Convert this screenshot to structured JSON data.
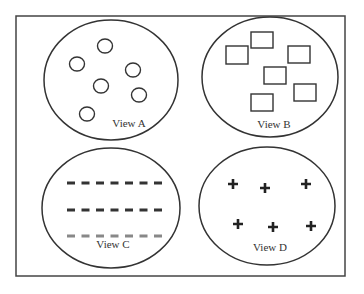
{
  "diagram": {
    "frame": {
      "x": 16,
      "y": 16,
      "width": 329,
      "height": 260,
      "stroke": "#444444"
    },
    "stroke_color": "#333333",
    "views": [
      {
        "id": "a",
        "label": "View A",
        "ellipse": {
          "cx": 111,
          "cy": 80,
          "rx": 67,
          "ry": 60
        },
        "label_pos": {
          "x": 129,
          "y": 127
        },
        "shape": "circle",
        "items": [
          {
            "x": 105,
            "y": 46
          },
          {
            "x": 77,
            "y": 64
          },
          {
            "x": 133,
            "y": 70
          },
          {
            "x": 101,
            "y": 86
          },
          {
            "x": 139,
            "y": 95
          },
          {
            "x": 87,
            "y": 114
          }
        ]
      },
      {
        "id": "b",
        "label": "View B",
        "ellipse": {
          "cx": 270,
          "cy": 77,
          "rx": 68,
          "ry": 60
        },
        "label_pos": {
          "x": 274,
          "y": 128
        },
        "shape": "square",
        "items": [
          {
            "x": 226,
            "y": 46,
            "w": 22,
            "h": 18
          },
          {
            "x": 251,
            "y": 32,
            "w": 22,
            "h": 16
          },
          {
            "x": 288,
            "y": 46,
            "w": 22,
            "h": 17
          },
          {
            "x": 264,
            "y": 67,
            "w": 22,
            "h": 17
          },
          {
            "x": 294,
            "y": 84,
            "w": 22,
            "h": 17
          },
          {
            "x": 251,
            "y": 94,
            "w": 22,
            "h": 17
          }
        ]
      },
      {
        "id": "c",
        "label": "View C",
        "ellipse": {
          "cx": 111,
          "cy": 208,
          "rx": 69,
          "ry": 60
        },
        "label_pos": {
          "x": 113,
          "y": 248
        },
        "shape": "dash",
        "rows": [
          {
            "y": 183,
            "color": "#333333",
            "count": 7,
            "x_start": 67,
            "spacing": 14.5
          },
          {
            "y": 210,
            "color": "#333333",
            "count": 7,
            "x_start": 67,
            "spacing": 14.5
          },
          {
            "y": 236,
            "color": "#888888",
            "count": 7,
            "x_start": 67,
            "spacing": 14.5
          }
        ]
      },
      {
        "id": "d",
        "label": "View D",
        "ellipse": {
          "cx": 267,
          "cy": 206,
          "rx": 68,
          "ry": 59
        },
        "label_pos": {
          "x": 270,
          "y": 251
        },
        "shape": "plus",
        "items": [
          {
            "x": 233,
            "y": 184
          },
          {
            "x": 265,
            "y": 188
          },
          {
            "x": 306,
            "y": 184
          },
          {
            "x": 238,
            "y": 224
          },
          {
            "x": 273,
            "y": 227
          },
          {
            "x": 311,
            "y": 226
          }
        ]
      }
    ]
  }
}
